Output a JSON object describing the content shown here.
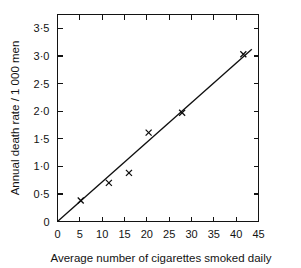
{
  "chart_data": {
    "type": "scatter",
    "title": "",
    "xlabel": "Average number of cigarettes smoked daily",
    "ylabel": "Annual death rate / 1 000 men",
    "xlim": [
      0,
      45
    ],
    "ylim": [
      0,
      3.75
    ],
    "grid": false,
    "legend": null,
    "x": [
      5.2,
      11.5,
      16.0,
      20.4,
      27.9,
      41.6
    ],
    "y": [
      0.38,
      0.7,
      0.88,
      1.61,
      1.97,
      3.03
    ],
    "points": [
      {
        "x": 5.2,
        "y": 0.38
      },
      {
        "x": 11.5,
        "y": 0.7
      },
      {
        "x": 16.0,
        "y": 0.88
      },
      {
        "x": 20.4,
        "y": 1.61
      },
      {
        "x": 27.9,
        "y": 1.97
      },
      {
        "x": 41.6,
        "y": 3.03
      }
    ],
    "marker": "x",
    "fit_line": {
      "type": "line",
      "label": "",
      "x": [
        0,
        43.5
      ],
      "y": [
        0,
        3.12
      ],
      "slope": 0.0717,
      "intercept": 0
    },
    "xticks": [
      0,
      5,
      10,
      15,
      20,
      25,
      30,
      35,
      40,
      45
    ],
    "xticklabels": [
      "0",
      "5",
      "10",
      "15",
      "20",
      "25",
      "30",
      "35",
      "40",
      "45"
    ],
    "yticks": [
      0,
      0.5,
      1.0,
      1.5,
      2.0,
      2.5,
      3.0,
      3.5
    ],
    "yticklabels": [
      "0",
      "0·5",
      "1·0",
      "1·5",
      "2·0",
      "2·5",
      "3·0",
      "3·5"
    ],
    "axis_color": "#131313",
    "line_color": "#0f0f0f",
    "marker_color": "#0d0d0d",
    "background": "#ffffff"
  }
}
